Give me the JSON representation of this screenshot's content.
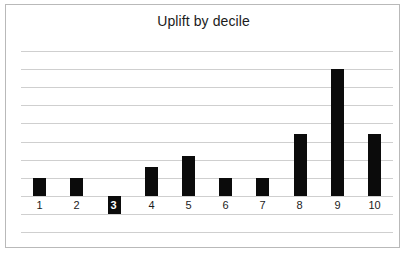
{
  "card": {
    "border_color": "#b9b9b9",
    "background_color": "#ffffff"
  },
  "chart_data": {
    "type": "bar",
    "title": "Uplift by decile",
    "subtitle": "",
    "xlabel": "",
    "ylabel": "",
    "categories": [
      "1",
      "2",
      "3",
      "4",
      "5",
      "6",
      "7",
      "8",
      "9",
      "10"
    ],
    "values": [
      1.0,
      1.0,
      -1.0,
      1.6,
      2.2,
      1.0,
      1.0,
      3.4,
      7.0,
      3.4
    ],
    "series": [
      {
        "name": "Uplift",
        "values": [
          1.0,
          1.0,
          -1.0,
          1.6,
          2.2,
          1.0,
          1.0,
          3.4,
          7.0,
          3.4
        ],
        "color": "#0b0b0b"
      }
    ],
    "ylim": [
      -2,
      8.5
    ],
    "y_tick_step": 1,
    "y_tick_labels_shown": false,
    "x_tick_labels_shown": true,
    "gridlines": {
      "horizontal": true,
      "vertical": false,
      "color": "#cfcfcf",
      "count": 11
    },
    "zero_line_value": 0,
    "legend": {
      "shown": false,
      "position": "none",
      "entries": []
    },
    "annotations": [
      {
        "category": "3",
        "note": "negative bar drawn below the zero line; its category label 3 is rendered in white on top of the bar"
      }
    ],
    "bar_color": "#0b0b0b",
    "bar_width_px": 13,
    "background_color": "#ffffff"
  }
}
